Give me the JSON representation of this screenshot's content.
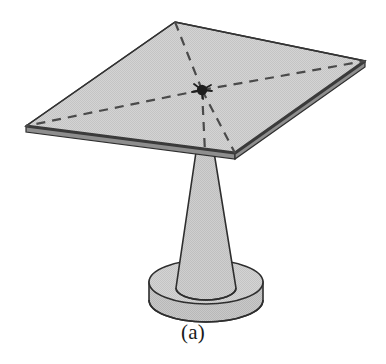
{
  "figure": {
    "caption": "(a)",
    "title": "Square plate supported by a tapered pedestal",
    "colors": {
      "background": "#ffffff",
      "plate_fill": "#cfcfcf",
      "plate_fill_light": "#d9d9d9",
      "stem_fill": "#c9c9c9",
      "base_top_fill": "#cccccc",
      "base_side_fill": "#c2c2c2",
      "outline": "#2e2e2e",
      "thick_edge": "#3a3a3a",
      "dashed_line": "#4a4a4a",
      "center_dot": "#1f1f1f",
      "caption_text": "#1a1a1a"
    },
    "geometry": {
      "plate_corners": {
        "left": [
          26,
          126
        ],
        "top": [
          175,
          22
        ],
        "right": [
          365,
          61
        ],
        "bottom": [
          235,
          153
        ]
      },
      "plate_thickness_px": 6,
      "center_point": [
        202,
        90
      ],
      "center_dot_radius_px": 5,
      "stem_top": [
        205,
        152
      ],
      "stem_top_half_width_px": 9,
      "stem_bottom_y": 292,
      "stem_bottom_half_width_px": 30,
      "base_center": [
        206,
        282
      ],
      "base_radius_x_px": 57,
      "base_radius_y_px": 22,
      "base_height_px": 24,
      "dashed_pattern": "9 7",
      "dashed_width_px": 2.2
    },
    "dashed_rays": [
      {
        "name": "center-to-left-corner",
        "from": [
          202,
          90
        ],
        "to": [
          26,
          126
        ]
      },
      {
        "name": "center-to-top-corner",
        "from": [
          202,
          90
        ],
        "to": [
          175,
          22
        ]
      },
      {
        "name": "center-to-right-corner",
        "from": [
          202,
          90
        ],
        "to": [
          365,
          61
        ]
      },
      {
        "name": "center-to-bottom-corner",
        "from": [
          202,
          90
        ],
        "to": [
          235,
          153
        ]
      },
      {
        "name": "center-to-stem-axis",
        "from": [
          202,
          90
        ],
        "to": [
          205,
          152
        ]
      }
    ]
  }
}
